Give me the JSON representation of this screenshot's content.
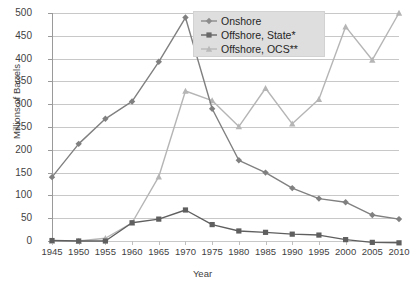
{
  "chart_data": {
    "type": "line",
    "title": "",
    "xlabel": "Year",
    "ylabel": "Millions of Barrels",
    "x": [
      1945,
      1950,
      1955,
      1960,
      1965,
      1970,
      1975,
      1980,
      1985,
      1990,
      1995,
      2000,
      2005,
      2010
    ],
    "xticklabels": [
      "1945",
      "1950",
      "1955",
      "1960",
      "1965",
      "1970",
      "1975",
      "1980",
      "1985",
      "1990",
      "1995",
      "2000",
      "2005",
      "2010"
    ],
    "yticklabels": [
      "0",
      "50",
      "100",
      "150",
      "200",
      "250",
      "300",
      "350",
      "400",
      "450",
      "500"
    ],
    "yticks": [
      0,
      50,
      100,
      150,
      200,
      250,
      300,
      350,
      400,
      450,
      500
    ],
    "ylim": [
      0,
      500
    ],
    "xlim": [
      1945,
      2010
    ],
    "grid": "horizontal",
    "legend_position": "top-center-right",
    "series": [
      {
        "name": "Onshore",
        "marker": "diamond",
        "color": "#808080",
        "values": [
          140,
          213,
          268,
          306,
          393,
          490,
          290,
          177,
          150,
          116,
          93,
          85,
          57,
          48
        ]
      },
      {
        "name": "Offshore, State*",
        "marker": "square",
        "color": "#5f5f5f",
        "values": [
          1,
          0,
          0,
          40,
          48,
          68,
          36,
          22,
          19,
          15,
          13,
          3,
          -3,
          -4
        ]
      },
      {
        "name": "Offshore, OCS**",
        "marker": "triangle",
        "color": "#b5b5b5",
        "values": [
          0,
          0,
          6,
          40,
          141,
          329,
          308,
          251,
          335,
          257,
          311,
          470,
          397,
          500
        ]
      }
    ]
  },
  "legend": {
    "items": [
      {
        "label": "Onshore",
        "marker": "diamond-marker",
        "color": "#8c8c8c"
      },
      {
        "label": "Offshore, State*",
        "marker": "square-marker",
        "color": "#686868"
      },
      {
        "label": "Offshore, OCS**",
        "marker": "triangle-marker",
        "color": "#b9b9b9"
      }
    ]
  },
  "axes": {
    "x_title": "Year",
    "y_title": "Millions of Barrels"
  },
  "artifact": {
    "corner_mark": ""
  }
}
